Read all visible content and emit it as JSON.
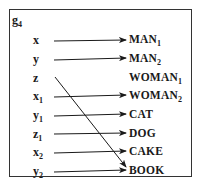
{
  "diagram": {
    "title": {
      "base": "g",
      "sub": "4"
    },
    "variables": [
      {
        "base": "x",
        "sub": ""
      },
      {
        "base": "y",
        "sub": ""
      },
      {
        "base": "z",
        "sub": ""
      },
      {
        "base": "x",
        "sub": "1"
      },
      {
        "base": "y",
        "sub": "1"
      },
      {
        "base": "z",
        "sub": "1"
      },
      {
        "base": "x",
        "sub": "2"
      },
      {
        "base": "y",
        "sub": "2"
      }
    ],
    "entities": [
      {
        "base": "MAN",
        "sub": "1"
      },
      {
        "base": "MAN",
        "sub": "2"
      },
      {
        "base": "WOMAN",
        "sub": "1"
      },
      {
        "base": "WOMAN",
        "sub": "2"
      },
      {
        "base": "CAT",
        "sub": ""
      },
      {
        "base": "DOG",
        "sub": ""
      },
      {
        "base": "CAKE",
        "sub": ""
      },
      {
        "base": "BOOK",
        "sub": ""
      }
    ],
    "mappings": [
      {
        "from": "x",
        "to": "MAN1"
      },
      {
        "from": "y",
        "to": "MAN2"
      },
      {
        "from": "z",
        "to": "BOOK"
      },
      {
        "from": "x1",
        "to": "WOMAN2"
      },
      {
        "from": "y1",
        "to": "CAT"
      },
      {
        "from": "z1",
        "to": "DOG"
      },
      {
        "from": "x2",
        "to": "CAKE"
      },
      {
        "from": "y2",
        "to": "BOOK"
      }
    ],
    "colors": {
      "line": "#1a1a1a",
      "border": "#333333",
      "background": "#ffffff"
    }
  }
}
